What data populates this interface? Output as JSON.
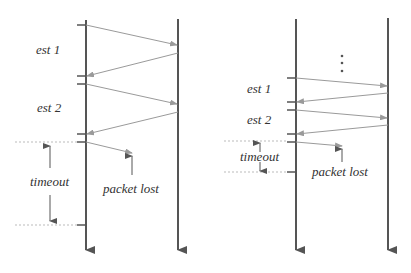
{
  "colors": {
    "timeline": "#555555",
    "message": "#9a9a9a",
    "dotted": "#bbbbbb",
    "label": "#333333",
    "background": "#ffffff"
  },
  "left_diagram": {
    "labels": {
      "est1": "est 1",
      "est2": "est 2",
      "timeout": "timeout",
      "packet_lost": "packet lost"
    }
  },
  "right_diagram": {
    "labels": {
      "est1": "est 1",
      "est2": "est 2",
      "timeout": "timeout",
      "packet_lost": "packet lost"
    },
    "ellipsis": "⋮"
  }
}
